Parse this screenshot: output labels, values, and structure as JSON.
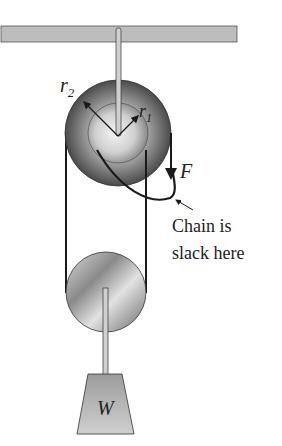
{
  "diagram": {
    "type": "physics-pulley-system",
    "labels": {
      "outer_radius": "r",
      "outer_radius_sub": "2",
      "inner_radius": "r",
      "inner_radius_sub": "1",
      "force": "F",
      "annotation_line1": "Chain is",
      "annotation_line2": "slack here",
      "weight": "W"
    },
    "colors": {
      "ceiling": "#bdbdbd",
      "pulley_dark": "#5a5a5a",
      "pulley_light": "#e6e6e6",
      "chain": "#1a1a1a",
      "weight": "#b5b5b5"
    }
  }
}
